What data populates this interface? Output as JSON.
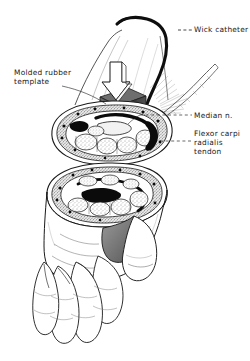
{
  "figure": {
    "style": "black-and-white medical line drawing with stipple shading",
    "background_color": "#ffffff",
    "ink_color": "#1a1a1a"
  },
  "labels": [
    {
      "id": "wick-catheter",
      "text": "Wick catheter",
      "lines": [
        "Wick catheter"
      ],
      "position": "top-right",
      "leader": "dashed-short"
    },
    {
      "id": "molded-rubber-template",
      "text": "Molded rubber template",
      "lines": [
        "Molded rubber",
        "template"
      ],
      "position": "left",
      "leader": "long-diagonal"
    },
    {
      "id": "median-nerve",
      "text": "Median n.",
      "lines": [
        "Median n."
      ],
      "position": "right",
      "leader": "dashed-short"
    },
    {
      "id": "flexor-carpi-radialis-tendon",
      "text": "Flexor carpi radialis tendon",
      "lines": [
        "Flexor carpi",
        "radialis",
        "tendon"
      ],
      "position": "right",
      "leader": "dashed-short"
    }
  ],
  "elements": {
    "catheter": {
      "name": "wick catheter tubing",
      "description": "thick black curved tube entering the wrist beneath the template",
      "color": "#111111"
    },
    "pressure_arrow": {
      "name": "downward block arrow",
      "description": "white outlined block arrow indicating applied compressive load",
      "fill": "#ffffff",
      "stroke": "#1a1a1a"
    },
    "rubber_block": {
      "name": "molded rubber template block",
      "description": "dark gray three-dimensional rectangular block pressed onto the volar wrist",
      "fill": "#4a4a4a"
    },
    "cross_section_upper": {
      "name": "proximal carpal tunnel cross-section",
      "description": "oval transverse section showing flexor tendons, median nerve and transverse carpal ligament"
    },
    "cross_section_lower": {
      "name": "distal carpal tunnel cross-section",
      "description": "second oval transverse section distal to the first"
    },
    "hand": {
      "name": "palmar view of hand",
      "description": "outline of palm, four fingers and thumb"
    }
  },
  "colors": {
    "ink": "#1a1a1a",
    "paper": "#ffffff",
    "block_gray": "#4a4a4a",
    "tissue_gray": "#8d8d8d",
    "dark_structure": "#0d0d0d"
  }
}
